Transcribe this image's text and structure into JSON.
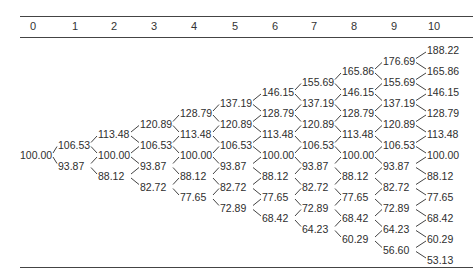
{
  "header": {
    "steps": [
      "0",
      "1",
      "2",
      "3",
      "4",
      "5",
      "6",
      "7",
      "8",
      "9",
      "10"
    ]
  },
  "tree": {
    "columns": [
      [
        "100.00"
      ],
      [
        "106.53",
        "93.87"
      ],
      [
        "113.48",
        "100.00",
        "88.12"
      ],
      [
        "120.89",
        "106.53",
        "93.87",
        "82.72"
      ],
      [
        "128.79",
        "113.48",
        "100.00",
        "88.12",
        "77.65"
      ],
      [
        "137.19",
        "120.89",
        "106.53",
        "93.87",
        "82.72",
        "72.89"
      ],
      [
        "146.15",
        "128.79",
        "113.48",
        "100.00",
        "88.12",
        "77.65",
        "68.42"
      ],
      [
        "155.69",
        "137.19",
        "120.89",
        "106.53",
        "93.87",
        "82.72",
        "72.89",
        "64.23"
      ],
      [
        "165.86",
        "146.15",
        "128.79",
        "113.48",
        "100.00",
        "88.12",
        "77.65",
        "68.42",
        "60.29"
      ],
      [
        "176.69",
        "155.69",
        "137.19",
        "120.89",
        "106.53",
        "93.87",
        "82.72",
        "72.89",
        "64.23",
        "56.60"
      ],
      [
        "188.22",
        "165.86",
        "146.15",
        "128.79",
        "113.48",
        "100.00",
        "88.12",
        "77.65",
        "68.42",
        "60.29",
        "53.13"
      ]
    ]
  },
  "layout": {
    "header_x": [
      33,
      75,
      114,
      154,
      194,
      235,
      275,
      314,
      354,
      394,
      434
    ],
    "label_x": [
      20,
      58,
      98,
      140,
      180,
      220,
      262,
      302,
      342,
      383,
      427
    ],
    "center_y": 155,
    "half_step": 10.5,
    "label_width": 32,
    "line_color": "#444444"
  }
}
